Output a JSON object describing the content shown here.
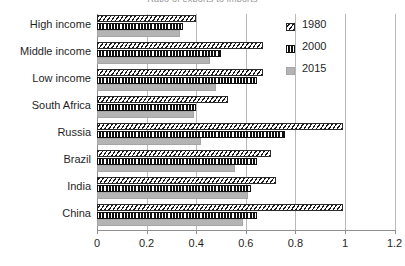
{
  "chart_data": {
    "type": "bar",
    "orientation": "horizontal",
    "title": "Ratio of exports to imports",
    "xlabel": "",
    "ylabel": "",
    "xlim": [
      0,
      1.2
    ],
    "xticks": [
      "0",
      "0.2",
      "0.4",
      "0.6",
      "0.8",
      "1",
      "1.2"
    ],
    "xtick_values": [
      0,
      0.2,
      0.4,
      0.6,
      0.8,
      1,
      1.2
    ],
    "grid": true,
    "legend_position": "inside-top-right",
    "categories": [
      "High income",
      "Middle income",
      "Low income",
      "South Africa",
      "Russia",
      "Brazil",
      "India",
      "China"
    ],
    "series": [
      {
        "name": "1980",
        "pattern": "diagonal-hatch",
        "color": "#1b1b1b",
        "values": [
          0.4,
          0.67,
          0.67,
          0.53,
          0.99,
          0.7,
          0.72,
          0.99
        ]
      },
      {
        "name": "2000",
        "pattern": "checkered-dark",
        "color": "#1b1b1b",
        "values": [
          0.345,
          0.5,
          0.645,
          0.4,
          0.76,
          0.645,
          0.62,
          0.645
        ]
      },
      {
        "name": "2015",
        "pattern": "solid-gray",
        "color": "#b4b4b4",
        "values": [
          0.335,
          0.455,
          0.48,
          0.39,
          0.42,
          0.555,
          0.61,
          0.59
        ]
      }
    ]
  }
}
